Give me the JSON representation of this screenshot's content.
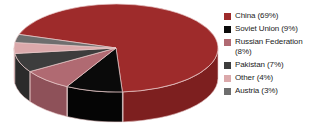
{
  "chart_data": {
    "type": "pie",
    "title": "",
    "subtitle": "",
    "xlabel": "",
    "ylabel": "",
    "style": "3d-exploded-cylinder",
    "legend_position": "right",
    "grid": false,
    "categories": [
      "China",
      "Soviet Union",
      "Russian Federation",
      "Pakistan",
      "Other",
      "Austria"
    ],
    "values": [
      69,
      9,
      8,
      7,
      4,
      3
    ],
    "unit": "%",
    "labels": [
      "China (69%)",
      "Soviet Union (9%)",
      "Russian Federation\n(8%)",
      "Pakistan (7%)",
      "Other (4%)",
      "Austria (3%)"
    ],
    "colors": [
      "#9e2b2b",
      "#0a0a0a",
      "#b06a72",
      "#3d3d3d",
      "#dba9ab",
      "#6e6e6e"
    ],
    "side_colors": [
      "#7d1f1f",
      "#050505",
      "#8e5159",
      "#2b2b2b",
      "#c08e92",
      "#555555"
    ]
  },
  "legend": {
    "items": [
      {
        "label": "China (69%)",
        "color": "#9e2b2b",
        "value": 69,
        "name": "China"
      },
      {
        "label": "Soviet Union (9%)",
        "color": "#0a0a0a",
        "value": 9,
        "name": "Soviet Union"
      },
      {
        "label": "Russian Federation\n(8%)",
        "color": "#b06a72",
        "value": 8,
        "name": "Russian Federation"
      },
      {
        "label": "Pakistan (7%)",
        "color": "#3d3d3d",
        "value": 7,
        "name": "Pakistan"
      },
      {
        "label": "Other (4%)",
        "color": "#dba9ab",
        "value": 4,
        "name": "Other"
      },
      {
        "label": "Austria (3%)",
        "color": "#6e6e6e",
        "value": 3,
        "name": "Austria"
      }
    ]
  },
  "canvas": {
    "background": "#ffffff",
    "outline_color": "#e8c7c7"
  }
}
